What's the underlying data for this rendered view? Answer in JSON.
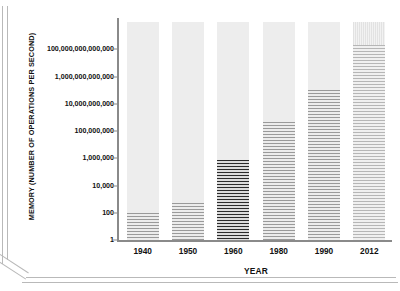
{
  "chart_data": {
    "type": "bar",
    "title": "",
    "subtitle": "",
    "xlabel": "YEAR",
    "ylabel": "MEMORY (NUMBER OF OPERATIONS PER SECOND)",
    "scale": "log",
    "grid": false,
    "legend": null,
    "categories": [
      "1940",
      "1950",
      "1960",
      "1980",
      "1990",
      "2012"
    ],
    "values": [
      100,
      1000,
      1000000,
      1000000000,
      100000000000,
      100000000000000
    ],
    "ytick_labels": [
      "1",
      "100",
      "10,000",
      "1,000,000",
      "100,000,000",
      "10,000,000,000",
      "1,000,000,000,000",
      "100,000,000,000,000"
    ],
    "ytick_values": [
      1,
      100,
      10000,
      1000000,
      100000000,
      10000000000,
      1000000000000,
      100000000000000
    ],
    "ylim": [
      1,
      1e+16
    ],
    "bars": [
      {
        "category": "1940",
        "value": 100,
        "value_label": "100",
        "fill_fraction": 0.124,
        "style": "light"
      },
      {
        "category": "1950",
        "value": 1000,
        "value_label": "1,000",
        "fill_fraction": 0.17,
        "style": "light"
      },
      {
        "category": "1960",
        "value": 1000000,
        "value_label": "1,000,000",
        "fill_fraction": 0.367,
        "style": "dark"
      },
      {
        "category": "1980",
        "value": 1000000000,
        "value_label": "1,000,000,000",
        "fill_fraction": 0.541,
        "style": "light"
      },
      {
        "category": "1990",
        "value": 100000000000,
        "value_label": "100,000,000,000",
        "fill_fraction": 0.688,
        "style": "light"
      },
      {
        "category": "2012",
        "value": 100000000000000,
        "value_label": "100,000,000,000,000",
        "fill_fraction": 0.894,
        "style": "faint"
      }
    ],
    "colors": {
      "bar_track": "#ededed",
      "bar_fill": "#9a9a9a",
      "bar_fill_highlight": "#2b2b2b",
      "axis": "#8a8a8a",
      "text": "#111111",
      "background": "#ffffff"
    }
  }
}
